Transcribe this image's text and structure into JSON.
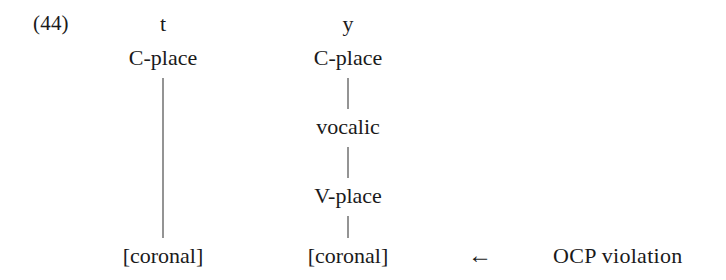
{
  "example": {
    "number_label": "(44)"
  },
  "columns": [
    {
      "name": "left-segment-t",
      "segment": "t",
      "tiers": [
        {
          "label": "C-place"
        },
        {
          "label": "[coronal]"
        }
      ]
    },
    {
      "name": "right-segment-y",
      "segment": "y",
      "tiers": [
        {
          "label": "C-place"
        },
        {
          "label": "vocalic"
        },
        {
          "label": "V-place"
        },
        {
          "label": "[coronal]"
        }
      ]
    }
  ],
  "annotation": {
    "arrow_glyph": "←",
    "arrow_icon_name": "arrow-left-icon",
    "text": "OCP violation"
  },
  "colors": {
    "background": "#ffffff",
    "text": "#1a1a1a",
    "line": "#2a2a2a"
  }
}
